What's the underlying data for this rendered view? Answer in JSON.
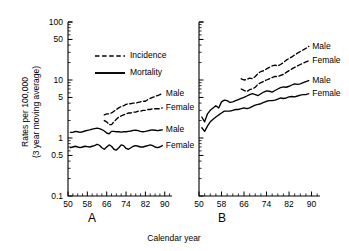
{
  "figure": {
    "x_axis_title": "Calendar year",
    "y_axis_title_line1": "Rates per 100,000",
    "y_axis_title_line2": "(3 year moving average)",
    "panel_a_label": "A",
    "panel_b_label": "B"
  },
  "legend": {
    "incidence_label": "Incidence",
    "mortality_label": "Mortality"
  },
  "labels": {
    "male": "Male",
    "female": "Female"
  },
  "axes": {
    "y_ticks": [
      "100",
      "50",
      "10",
      "5",
      "1",
      "0.5",
      "0.1"
    ],
    "y_tick_values": [
      100,
      50,
      10,
      5,
      1,
      0.5,
      0.1
    ],
    "x_ticks": [
      "50",
      "58",
      "66",
      "74",
      "82",
      "90"
    ],
    "x_tick_values": [
      50,
      58,
      66,
      74,
      82,
      90
    ],
    "y_min": 0.1,
    "y_max": 100,
    "x_min": 50,
    "x_max": 93,
    "y_scale": "log",
    "x_scale": "linear"
  },
  "chart_data": {
    "type": "line",
    "title": "",
    "subtitle": "",
    "xlabel": "Calendar year",
    "ylabel": "Rates per 100,000 (3 year moving average)",
    "xlim": [
      50,
      93
    ],
    "ylim": [
      0.1,
      100
    ],
    "yscale": "log",
    "grid": false,
    "legend_position": "upper-left-inside-panel-a",
    "legend_entries": [
      {
        "name": "Incidence",
        "style": "dashed"
      },
      {
        "name": "Mortality",
        "style": "solid"
      }
    ],
    "panels": [
      {
        "panel": "A",
        "label": "A",
        "series": [
          {
            "name": "Incidence Male",
            "style": "dashed",
            "end_label": "Male",
            "x": [
              65,
              66,
              67,
              68,
              69,
              70,
              71,
              72,
              73,
              74,
              75,
              76,
              77,
              78,
              79,
              80,
              81,
              82,
              83,
              84,
              85,
              86,
              87,
              88,
              89
            ],
            "values": [
              2.5,
              2.6,
              2.6,
              2.7,
              2.9,
              3.1,
              3.3,
              3.5,
              3.6,
              3.8,
              3.9,
              3.9,
              4.0,
              4.0,
              4.1,
              4.2,
              4.3,
              4.3,
              4.6,
              4.8,
              5.0,
              5.2,
              5.4,
              5.6,
              5.9
            ]
          },
          {
            "name": "Incidence Female",
            "style": "dashed",
            "end_label": "Female",
            "x": [
              65,
              66,
              67,
              68,
              69,
              70,
              71,
              72,
              73,
              74,
              75,
              76,
              77,
              78,
              79,
              80,
              81,
              82,
              83,
              84,
              85,
              86,
              87,
              88,
              89
            ],
            "values": [
              2.0,
              1.9,
              1.7,
              1.7,
              1.9,
              2.1,
              2.3,
              2.4,
              2.5,
              2.6,
              2.7,
              2.7,
              2.8,
              2.8,
              2.9,
              2.9,
              3.0,
              3.0,
              3.1,
              3.1,
              3.2,
              3.2,
              3.2,
              3.2,
              3.3
            ]
          },
          {
            "name": "Mortality Male",
            "style": "solid",
            "end_label": "Male",
            "x": [
              51,
              52,
              53,
              54,
              55,
              56,
              57,
              58,
              59,
              60,
              61,
              62,
              63,
              64,
              65,
              66,
              67,
              68,
              69,
              70,
              71,
              72,
              73,
              74,
              75,
              76,
              77,
              78,
              79,
              80,
              81,
              82,
              83,
              84,
              85,
              86,
              87,
              88,
              89
            ],
            "values": [
              1.25,
              1.25,
              1.3,
              1.28,
              1.25,
              1.28,
              1.32,
              1.35,
              1.38,
              1.42,
              1.45,
              1.48,
              1.45,
              1.4,
              1.32,
              1.22,
              1.18,
              1.3,
              1.3,
              1.28,
              1.28,
              1.26,
              1.28,
              1.28,
              1.3,
              1.32,
              1.35,
              1.36,
              1.34,
              1.3,
              1.28,
              1.3,
              1.33,
              1.36,
              1.38,
              1.36,
              1.34,
              1.36,
              1.38
            ]
          },
          {
            "name": "Mortality Female",
            "style": "solid",
            "end_label": "Female",
            "x": [
              51,
              52,
              53,
              54,
              55,
              56,
              57,
              58,
              59,
              60,
              61,
              62,
              63,
              64,
              65,
              66,
              67,
              68,
              69,
              70,
              71,
              72,
              73,
              74,
              75,
              76,
              77,
              78,
              79,
              80,
              81,
              82,
              83,
              84,
              85,
              86,
              87,
              88,
              89
            ],
            "values": [
              0.68,
              0.7,
              0.72,
              0.7,
              0.68,
              0.7,
              0.72,
              0.71,
              0.7,
              0.72,
              0.74,
              0.78,
              0.75,
              0.68,
              0.64,
              0.7,
              0.76,
              0.72,
              0.64,
              0.62,
              0.68,
              0.76,
              0.74,
              0.66,
              0.64,
              0.68,
              0.72,
              0.74,
              0.72,
              0.7,
              0.7,
              0.72,
              0.74,
              0.76,
              0.74,
              0.7,
              0.68,
              0.7,
              0.74
            ]
          }
        ]
      },
      {
        "panel": "B",
        "label": "B",
        "series": [
          {
            "name": "Incidence Male",
            "style": "dashed",
            "end_label": "Male",
            "x": [
              65,
              66,
              67,
              68,
              69,
              70,
              71,
              72,
              73,
              74,
              75,
              76,
              77,
              78,
              79,
              80,
              81,
              82,
              83,
              84,
              85,
              86,
              87,
              88,
              89
            ],
            "values": [
              10.5,
              10.0,
              10.2,
              10.8,
              10.5,
              11.5,
              13.0,
              14.0,
              14.5,
              15.5,
              16.5,
              17.5,
              18.0,
              17.5,
              18.5,
              20.0,
              22.0,
              23.5,
              25.0,
              27.0,
              29.0,
              31.0,
              33.0,
              35.0,
              38.0
            ]
          },
          {
            "name": "Incidence Female",
            "style": "dashed",
            "end_label": "Female",
            "x": [
              65,
              66,
              67,
              68,
              69,
              70,
              71,
              72,
              73,
              74,
              75,
              76,
              77,
              78,
              79,
              80,
              81,
              82,
              83,
              84,
              85,
              86,
              87,
              88,
              89
            ],
            "values": [
              7.0,
              6.6,
              6.3,
              6.8,
              7.0,
              7.5,
              8.5,
              9.0,
              9.5,
              10.0,
              10.5,
              11.0,
              11.5,
              11.5,
              12.0,
              12.5,
              13.5,
              14.5,
              15.5,
              16.5,
              17.5,
              18.5,
              19.5,
              20.5,
              21.5
            ]
          },
          {
            "name": "Mortality Male",
            "style": "solid",
            "end_label": "Male",
            "x": [
              51,
              52,
              53,
              54,
              55,
              56,
              57,
              58,
              59,
              60,
              61,
              62,
              63,
              64,
              65,
              66,
              67,
              68,
              69,
              70,
              71,
              72,
              73,
              74,
              75,
              76,
              77,
              78,
              79,
              80,
              81,
              82,
              83,
              84,
              85,
              86,
              87,
              88,
              89
            ],
            "values": [
              2.3,
              1.9,
              2.6,
              3.0,
              3.3,
              3.6,
              3.3,
              4.2,
              4.5,
              4.4,
              4.1,
              4.2,
              4.4,
              4.6,
              4.8,
              5.0,
              5.3,
              5.6,
              5.8,
              5.6,
              5.4,
              5.8,
              6.2,
              6.5,
              6.4,
              6.2,
              6.6,
              7.0,
              7.4,
              7.6,
              7.5,
              7.8,
              8.2,
              8.6,
              8.4,
              8.6,
              9.0,
              9.4,
              9.8
            ]
          },
          {
            "name": "Mortality Female",
            "style": "solid",
            "end_label": "Female",
            "x": [
              51,
              52,
              53,
              54,
              55,
              56,
              57,
              58,
              59,
              60,
              61,
              62,
              63,
              64,
              65,
              66,
              67,
              68,
              69,
              70,
              71,
              72,
              73,
              74,
              75,
              76,
              77,
              78,
              79,
              80,
              81,
              82,
              83,
              84,
              85,
              86,
              87,
              88,
              89
            ],
            "values": [
              1.5,
              1.3,
              1.6,
              1.9,
              2.1,
              2.3,
              2.5,
              2.7,
              2.9,
              2.9,
              2.9,
              3.0,
              3.1,
              3.1,
              3.2,
              3.3,
              3.2,
              3.3,
              3.5,
              3.7,
              3.8,
              3.9,
              4.1,
              4.3,
              4.4,
              4.4,
              4.5,
              4.7,
              4.9,
              4.8,
              4.9,
              5.1,
              5.2,
              5.1,
              5.3,
              5.5,
              5.6,
              5.6,
              5.8
            ]
          }
        ]
      }
    ]
  }
}
